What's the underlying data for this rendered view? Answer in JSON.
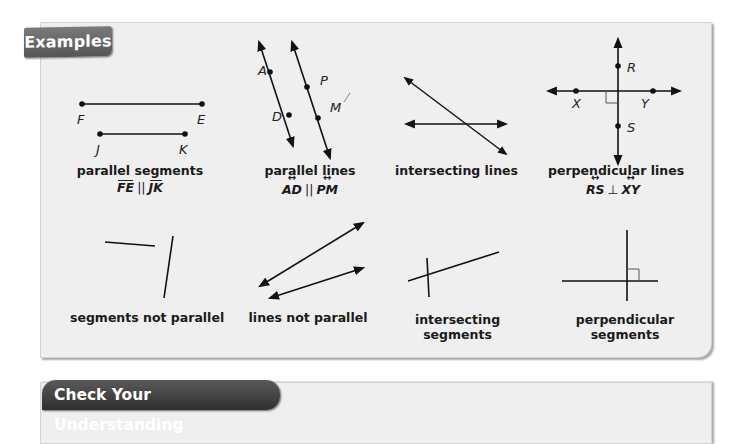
{
  "examples": {
    "tab_label": "Examples",
    "figures": [
      {
        "id": "parallel-segments",
        "caption": "parallel segments",
        "notation": {
          "left": "FE",
          "op": "||",
          "right": "JK",
          "mark": "segment-bar"
        },
        "points": [
          "F",
          "E",
          "J",
          "K"
        ]
      },
      {
        "id": "parallel-lines",
        "caption": "parallel lines",
        "notation": {
          "left": "AD",
          "op": "||",
          "right": "PM",
          "mark": "line-arrow"
        },
        "points": [
          "A",
          "D",
          "P",
          "M"
        ]
      },
      {
        "id": "intersecting-lines",
        "caption": "intersecting lines"
      },
      {
        "id": "perpendicular-lines",
        "caption": "perpendicular lines",
        "notation": {
          "left": "RS",
          "op": "⊥",
          "right": "XY",
          "mark": "line-arrow"
        },
        "points": [
          "R",
          "S",
          "X",
          "Y"
        ]
      },
      {
        "id": "segments-not-parallel",
        "caption": "segments not parallel"
      },
      {
        "id": "lines-not-parallel",
        "caption": "lines not parallel"
      },
      {
        "id": "intersecting-segments",
        "caption_line1": "intersecting",
        "caption_line2": "segments"
      },
      {
        "id": "perpendicular-segments",
        "caption_line1": "perpendicular",
        "caption_line2": "segments"
      }
    ]
  },
  "check": {
    "tab_label": "Check Your Understanding"
  },
  "colors": {
    "panel_bg": "#efefef",
    "tab_bg": "#666666",
    "check_tab_bg": "#3f3f3f",
    "ink": "#1a1a1a"
  }
}
